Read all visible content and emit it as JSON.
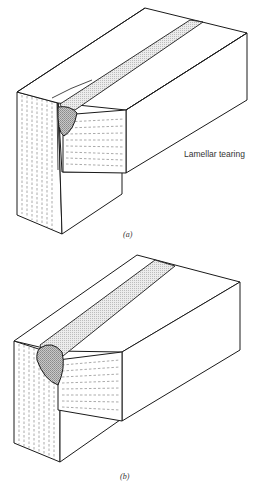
{
  "figures": [
    {
      "id": "a",
      "caption": "(a)",
      "annotation": "Lamellar tearing"
    },
    {
      "id": "b",
      "caption": "(b)"
    }
  ],
  "colors": {
    "line": "#1a1a1a",
    "bead_fill": "#d9d9d9",
    "nugget_fill": "#a8a8a8",
    "background": "#ffffff"
  }
}
